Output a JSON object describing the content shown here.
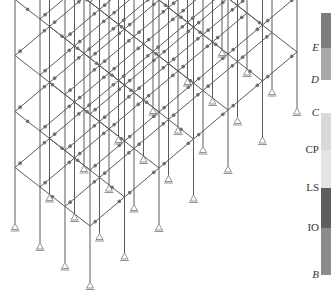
{
  "figure": {
    "colors": {
      "frame_line": "#5a5a5a",
      "hinge": "#6e6e6e",
      "support": "#888888",
      "background": "#ffffff"
    }
  },
  "frame": {
    "_note": "Projection/grid values are visual estimates chosen to reproduce the drawing; they are not measured from the image.",
    "stories": 5,
    "bays_long": 6,
    "bays_short": 3,
    "origin": {
      "x": 90,
      "y": 282
    },
    "long_vec": {
      "x": 34.5,
      "y": -29.0
    },
    "short_vec": {
      "x": -25.0,
      "y": -19.5
    },
    "story_height": 56,
    "roof_overhang": 0
  },
  "legend": {
    "title": "",
    "labels": [
      {
        "text": "E",
        "y": 48,
        "italic": true
      },
      {
        "text": "D",
        "y": 80,
        "italic": true
      },
      {
        "text": "C",
        "y": 113,
        "italic": true
      },
      {
        "text": "CP",
        "y": 150,
        "italic": false
      },
      {
        "text": "LS",
        "y": 188,
        "italic": false
      },
      {
        "text": "IO",
        "y": 228,
        "italic": false
      },
      {
        "text": "B",
        "y": 275,
        "italic": true
      }
    ],
    "segments": [
      {
        "name": "beyond-E",
        "top": 13,
        "bottom": 48,
        "color": "#7d7d7d"
      },
      {
        "name": "D-E",
        "top": 48,
        "bottom": 80,
        "color": "#a8a8a8"
      },
      {
        "name": "C-CP",
        "top": 113,
        "bottom": 150,
        "color": "#d9d9d9"
      },
      {
        "name": "CP-LS",
        "top": 150,
        "bottom": 188,
        "color": "#e4e4e4"
      },
      {
        "name": "LS-IO",
        "top": 188,
        "bottom": 228,
        "color": "#5e5e5e"
      },
      {
        "name": "IO-B",
        "top": 228,
        "bottom": 275,
        "color": "#8c8c8c"
      }
    ]
  }
}
